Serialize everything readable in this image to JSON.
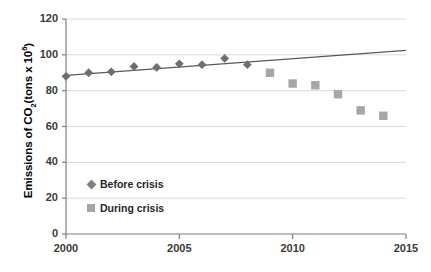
{
  "chart_data": {
    "type": "scatter",
    "title": "",
    "xlabel": "",
    "ylabel": "Emissions of CO2 (tons x 10^6)",
    "ylabel_parts": {
      "prefix": "Emissions of CO",
      "sub": "2",
      "mid": "(tons x 10",
      "sup": "6",
      "suffix": ")"
    },
    "xlim": [
      2000,
      2015
    ],
    "ylim": [
      0,
      120
    ],
    "ytick_values": [
      0,
      20,
      40,
      60,
      80,
      100,
      120
    ],
    "ytick_labels": [
      "0",
      "20",
      "40",
      "60",
      "80",
      "100",
      "120"
    ],
    "xtick_values": [
      2000,
      2005,
      2010,
      2015
    ],
    "xtick_labels": [
      "2000",
      "2005",
      "2010",
      "2015"
    ],
    "grid": "horizontal",
    "legend_position": "inside-lower-left",
    "series": [
      {
        "name": "Before crisis",
        "marker": "diamond",
        "color": "#6e6e6e",
        "x": [
          2000,
          2001,
          2002,
          2003,
          2004,
          2005,
          2006,
          2007,
          2008
        ],
        "values": [
          88,
          90,
          90.5,
          93.5,
          93,
          95,
          94.5,
          98,
          94.5
        ]
      },
      {
        "name": "During crisis",
        "marker": "square",
        "color": "#a6a6a6",
        "x": [
          2009,
          2010,
          2011,
          2012,
          2013,
          2014
        ],
        "values": [
          90,
          84,
          83,
          78,
          69,
          66
        ]
      }
    ],
    "trendline": {
      "name": "linear-trend",
      "color": "#595959",
      "x": [
        2000,
        2015
      ],
      "values": [
        88.5,
        102.5
      ]
    },
    "legend": [
      {
        "label": "Before crisis",
        "marker": "diamond"
      },
      {
        "label": "During crisis",
        "marker": "square"
      }
    ]
  }
}
